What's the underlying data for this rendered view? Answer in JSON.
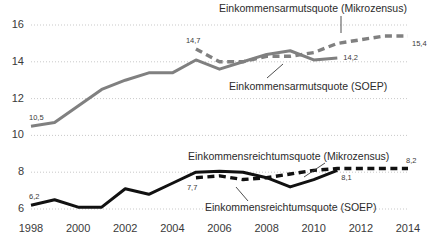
{
  "chart_data": {
    "type": "line",
    "title": "",
    "xlabel": "",
    "ylabel": "",
    "xlim": [
      1998,
      2014
    ],
    "ylim": [
      5.6,
      16.6
    ],
    "grid": true,
    "legend_position": "inline-annotations",
    "x": [
      1998,
      1999,
      2000,
      2001,
      2002,
      2003,
      2004,
      2005,
      2006,
      2007,
      2008,
      2009,
      2010,
      2011,
      2012,
      2013,
      2014
    ],
    "yticks": [
      6,
      8,
      10,
      12,
      14,
      16
    ],
    "ytick_labels": [
      "6",
      "8",
      "10",
      "12",
      "14",
      "16"
    ],
    "xticks": [
      1998,
      2000,
      2002,
      2004,
      2006,
      2008,
      2010,
      2012,
      2014
    ],
    "xtick_labels": [
      "1998",
      "2000",
      "2002",
      "2004",
      "2006",
      "2008",
      "2010",
      "2012",
      "2014"
    ],
    "series": [
      {
        "name": "Einkommensarmutsquote (SOEP)",
        "style": "solid",
        "color": "#808080",
        "x": [
          1998,
          1999,
          2000,
          2001,
          2002,
          2003,
          2004,
          2005,
          2006,
          2007,
          2008,
          2009,
          2010,
          2011
        ],
        "values": [
          10.5,
          10.7,
          11.6,
          12.5,
          13.0,
          13.4,
          13.4,
          14.1,
          13.6,
          14.0,
          14.4,
          14.6,
          14.1,
          14.2
        ]
      },
      {
        "name": "Einkommensarmutsquote (Mikrozensus)",
        "style": "dashed",
        "color": "#808080",
        "x": [
          2005,
          2006,
          2007,
          2008,
          2009,
          2010,
          2011,
          2012,
          2013,
          2014
        ],
        "values": [
          14.7,
          14.0,
          14.0,
          14.3,
          14.3,
          14.5,
          15.0,
          15.2,
          15.4,
          15.4
        ]
      },
      {
        "name": "Einkommensreichtumsquote (SOEP)",
        "style": "solid",
        "color": "#111111",
        "x": [
          1998,
          1999,
          2000,
          2001,
          2002,
          2003,
          2004,
          2005,
          2006,
          2007,
          2008,
          2009,
          2010,
          2011
        ],
        "values": [
          6.2,
          6.5,
          6.1,
          6.1,
          7.1,
          6.8,
          7.4,
          8.0,
          8.05,
          8.0,
          7.7,
          7.2,
          7.6,
          8.1
        ]
      },
      {
        "name": "Einkommensreichtumsquote (Mikrozensus)",
        "style": "dashed",
        "color": "#111111",
        "x": [
          2005,
          2006,
          2007,
          2008,
          2009,
          2010,
          2011,
          2012,
          2013,
          2014
        ],
        "values": [
          7.7,
          7.8,
          7.6,
          7.7,
          7.9,
          8.1,
          8.2,
          8.2,
          8.2,
          8.2
        ]
      }
    ],
    "point_labels": [
      {
        "text": "10,5",
        "x": 1998,
        "y": 10.5,
        "anchor": "above-right"
      },
      {
        "text": "14,7",
        "x": 2005,
        "y": 14.7,
        "anchor": "above"
      },
      {
        "text": "14,2",
        "x": 2011,
        "y": 14.2,
        "anchor": "right"
      },
      {
        "text": "15,4",
        "x": 2014,
        "y": 15.4,
        "anchor": "below-right"
      },
      {
        "text": "6,2",
        "x": 1998,
        "y": 6.2,
        "anchor": "above-right"
      },
      {
        "text": "7,7",
        "x": 2005,
        "y": 7.7,
        "anchor": "below"
      },
      {
        "text": "8,1",
        "x": 2011,
        "y": 8.1,
        "anchor": "below-right"
      },
      {
        "text": "8,2",
        "x": 2014,
        "y": 8.2,
        "anchor": "above-right"
      }
    ],
    "annotations": [
      {
        "id": "ann-poverty-mikrozensus",
        "text": "Einkommensarmutsquote (Mikrozensus)",
        "leader": true
      },
      {
        "id": "ann-poverty-soep",
        "text": "Einkommensarmutsquote (SOEP)",
        "leader": true
      },
      {
        "id": "ann-wealth-mikrozensus",
        "text": "Einkommensreichtumsquote (Mikrozensus)",
        "leader": true
      },
      {
        "id": "ann-wealth-soep",
        "text": "Einkommensreichtumsquote (SOEP)",
        "leader": true
      }
    ],
    "colors": {
      "soep_line": "#808080",
      "mikrozensus_poverty_line": "#808080",
      "wealth_line": "#111111",
      "gridline": "#c9c9c9",
      "text": "#3a3a3a",
      "background": "#ffffff"
    }
  }
}
